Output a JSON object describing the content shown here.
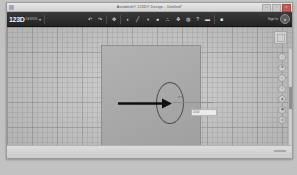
{
  "window": {
    "title": "Autodesk® 123D® Design - Untitled*",
    "system_icon": "app-icon",
    "buttons": [
      {
        "name": "minimize",
        "glyph": "–"
      },
      {
        "name": "maximize",
        "glyph": "□"
      },
      {
        "name": "close",
        "glyph": "×"
      }
    ]
  },
  "toolbar": {
    "brand_main": "123D",
    "brand_sub": "DESIGN",
    "brand_caret": "▾",
    "sign_in_label": "Sign In",
    "avatar_glyph": "●",
    "groups": [
      {
        "name": "history-group",
        "items": [
          {
            "name": "undo-icon",
            "glyph": "↶"
          },
          {
            "name": "redo-icon",
            "glyph": "↷"
          }
        ]
      },
      {
        "name": "transform-group",
        "items": [
          {
            "name": "transform-icon",
            "glyph": "✥"
          }
        ]
      },
      {
        "name": "modeling-group",
        "items": [
          {
            "name": "primitives-icon",
            "glyph": "◖"
          },
          {
            "name": "sketch-icon",
            "glyph": "╱"
          },
          {
            "name": "construct-icon",
            "glyph": "◑"
          },
          {
            "name": "modify-icon",
            "glyph": "●"
          },
          {
            "name": "pattern-icon",
            "glyph": "∴"
          },
          {
            "name": "grouping-icon",
            "glyph": "❖"
          },
          {
            "name": "combine-icon",
            "glyph": "◍"
          },
          {
            "name": "measure-icon",
            "glyph": "?"
          },
          {
            "name": "material-icon",
            "glyph": "▬"
          }
        ]
      },
      {
        "name": "snap-group",
        "items": [
          {
            "name": "snap-icon",
            "glyph": "■"
          }
        ]
      }
    ]
  },
  "canvas": {
    "plane_name": "sketch-plane",
    "ellipse_name": "ellipse-sketch",
    "arrow_name": "extrude-arrow",
    "dimension_label": "mm",
    "dimension_value": "10.00",
    "grid": "on"
  },
  "viewcube": {
    "name": "view-cube",
    "face_label": "TOP"
  },
  "navbar": {
    "items": [
      {
        "name": "home-icon",
        "glyph": "⌂"
      },
      {
        "name": "pan-icon",
        "glyph": "✚"
      },
      {
        "name": "zoom-icon",
        "glyph": "⌕"
      },
      {
        "name": "orbit-icon",
        "glyph": "○"
      },
      {
        "name": "look-at-icon",
        "glyph": "◉"
      },
      {
        "name": "fit-icon",
        "glyph": "▣"
      },
      {
        "name": "settings-icon",
        "glyph": "⚙"
      }
    ]
  },
  "scrollbar": {
    "name": "vertical-scrollbar"
  }
}
